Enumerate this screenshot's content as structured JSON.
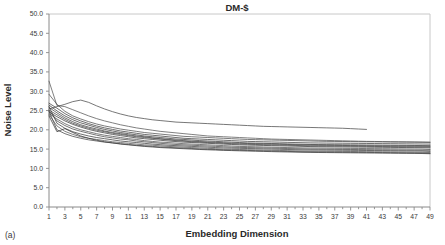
{
  "figure": {
    "panel_label": "(a)"
  },
  "chart_data": {
    "type": "line",
    "title": "DM-$",
    "xlabel": "Embedding Dimension",
    "ylabel": "Noise Level",
    "xlim": [
      1,
      49
    ],
    "ylim": [
      0.0,
      50.0
    ],
    "grid": false,
    "legend": "none",
    "y_ticks": [
      "0.0",
      "5.0",
      "10.0",
      "15.0",
      "20.0",
      "25.0",
      "30.0",
      "35.0",
      "40.0",
      "45.0",
      "50.0"
    ],
    "y_tick_values": [
      0.0,
      5.0,
      10.0,
      15.0,
      20.0,
      25.0,
      30.0,
      35.0,
      40.0,
      45.0,
      50.0
    ],
    "x_ticks": [
      "1",
      "3",
      "5",
      "7",
      "9",
      "11",
      "13",
      "15",
      "17",
      "19",
      "21",
      "23",
      "25",
      "27",
      "29",
      "31",
      "33",
      "35",
      "37",
      "39",
      "41",
      "43",
      "45",
      "47",
      "49"
    ],
    "x_tick_values": [
      1,
      3,
      5,
      7,
      9,
      11,
      13,
      15,
      17,
      19,
      21,
      23,
      25,
      27,
      29,
      31,
      33,
      35,
      37,
      39,
      41,
      43,
      45,
      47,
      49
    ],
    "x_minor_step": 1,
    "x": [
      1,
      2,
      3,
      4,
      5,
      6,
      7,
      8,
      9,
      10,
      11,
      12,
      13,
      14,
      15,
      16,
      17,
      18,
      19,
      20,
      21,
      22,
      23,
      24,
      25,
      26,
      27,
      28,
      29,
      30,
      31,
      32,
      33,
      34,
      35,
      36,
      37,
      38,
      39,
      40,
      41,
      42,
      43,
      44,
      45,
      46,
      47,
      48,
      49
    ],
    "series": [
      {
        "name": "curve-1",
        "color": "#4a4a4a",
        "values": [
          25.4,
          26.0,
          26.6,
          27.3,
          27.7,
          27.1,
          26.2,
          25.4,
          24.7,
          24.1,
          23.6,
          23.2,
          22.9,
          22.6,
          22.4,
          22.2,
          22.0,
          21.9,
          21.8,
          21.7,
          21.6,
          21.5,
          21.4,
          21.3,
          21.2,
          21.1,
          21.0,
          20.9,
          20.85,
          20.8,
          20.75,
          20.7,
          20.65,
          20.6,
          20.55,
          20.5,
          20.45,
          20.4,
          20.3,
          20.2,
          20.1,
          null,
          null,
          null,
          null,
          null,
          null,
          null,
          null
        ]
      },
      {
        "name": "curve-2",
        "color": "#555555",
        "values": [
          32.6,
          26.3,
          26.0,
          25.2,
          24.4,
          23.6,
          22.9,
          22.3,
          21.8,
          21.3,
          20.9,
          20.5,
          20.2,
          19.9,
          19.6,
          19.4,
          19.2,
          19.0,
          18.8,
          18.6,
          18.4,
          18.3,
          18.2,
          18.1,
          18.0,
          17.9,
          17.8,
          17.7,
          17.6,
          17.55,
          17.5,
          17.45,
          17.4,
          17.35,
          17.3,
          17.25,
          17.2,
          17.15,
          17.1,
          17.05,
          17.0,
          16.98,
          16.95,
          16.92,
          16.9,
          16.88,
          16.86,
          16.84,
          16.8
        ]
      },
      {
        "name": "curve-3",
        "color": "#4f4f4f",
        "values": [
          29.2,
          26.6,
          24.8,
          23.6,
          22.8,
          22.1,
          21.5,
          21.0,
          20.6,
          20.2,
          19.9,
          19.6,
          19.3,
          19.1,
          18.9,
          18.7,
          18.5,
          18.3,
          18.2,
          18.1,
          18.0,
          17.9,
          17.8,
          17.7,
          17.6,
          17.5,
          17.45,
          17.4,
          17.35,
          17.3,
          17.25,
          17.2,
          17.15,
          17.1,
          17.05,
          17.0,
          16.98,
          16.96,
          16.94,
          16.92,
          16.9,
          16.88,
          16.86,
          16.84,
          16.82,
          16.8,
          16.78,
          16.76,
          16.74
        ]
      },
      {
        "name": "curve-4",
        "color": "#3f3f3f",
        "values": [
          26.9,
          25.6,
          24.2,
          23.1,
          22.3,
          21.6,
          21.0,
          20.5,
          20.1,
          19.7,
          19.4,
          19.1,
          18.8,
          18.6,
          18.4,
          18.2,
          18.0,
          17.8,
          17.7,
          17.6,
          17.5,
          17.4,
          17.3,
          17.2,
          17.1,
          17.0,
          16.95,
          16.9,
          16.85,
          16.8,
          16.75,
          16.7,
          16.65,
          16.6,
          16.58,
          16.56,
          16.54,
          16.52,
          16.5,
          16.48,
          16.46,
          16.44,
          16.42,
          16.4,
          16.38,
          16.36,
          16.34,
          16.32,
          16.3
        ]
      },
      {
        "name": "curve-5",
        "color": "#3a3a3a",
        "values": [
          26.4,
          24.9,
          23.6,
          22.6,
          21.8,
          21.2,
          20.6,
          20.1,
          19.7,
          19.3,
          19.0,
          18.7,
          18.4,
          18.2,
          18.0,
          17.8,
          17.6,
          17.5,
          17.35,
          17.2,
          17.1,
          17.0,
          16.9,
          16.8,
          16.7,
          16.6,
          16.55,
          16.5,
          16.45,
          16.4,
          16.35,
          16.3,
          16.25,
          16.2,
          16.18,
          16.16,
          16.14,
          16.12,
          16.1,
          16.08,
          16.06,
          16.04,
          16.02,
          16.0,
          15.98,
          15.96,
          15.94,
          15.92,
          15.9
        ]
      },
      {
        "name": "curve-6",
        "color": "#454545",
        "values": [
          25.8,
          24.4,
          23.1,
          22.1,
          21.3,
          20.7,
          20.2,
          19.7,
          19.3,
          19.0,
          18.7,
          18.4,
          18.2,
          17.9,
          17.7,
          17.5,
          17.35,
          17.2,
          17.05,
          16.95,
          16.85,
          16.75,
          16.65,
          16.55,
          16.5,
          16.45,
          16.4,
          16.35,
          16.3,
          16.25,
          16.2,
          16.15,
          16.1,
          16.05,
          16.0,
          15.98,
          15.96,
          15.94,
          15.92,
          15.9,
          15.88,
          15.86,
          15.84,
          15.82,
          15.8,
          15.78,
          15.76,
          15.74,
          15.7
        ]
      },
      {
        "name": "curve-7",
        "color": "#4a4a4a",
        "values": [
          25.1,
          23.9,
          22.7,
          21.7,
          21.0,
          20.4,
          19.9,
          19.5,
          19.1,
          18.8,
          18.5,
          18.2,
          18.0,
          17.8,
          17.6,
          17.4,
          17.2,
          17.05,
          16.9,
          16.8,
          16.7,
          16.6,
          16.5,
          16.4,
          16.3,
          16.25,
          16.2,
          16.15,
          16.1,
          16.05,
          16.0,
          15.95,
          15.9,
          15.85,
          15.82,
          15.8,
          15.78,
          15.76,
          15.74,
          15.72,
          15.7,
          15.68,
          15.66,
          15.64,
          15.62,
          15.6,
          15.58,
          15.56,
          15.5
        ]
      },
      {
        "name": "curve-8",
        "color": "#3c3c3c",
        "values": [
          24.6,
          23.4,
          22.3,
          21.4,
          20.7,
          20.1,
          19.6,
          19.2,
          18.8,
          18.5,
          18.2,
          17.9,
          17.7,
          17.5,
          17.3,
          17.1,
          16.95,
          16.8,
          16.7,
          16.6,
          16.5,
          16.4,
          16.3,
          16.2,
          16.1,
          16.05,
          16.0,
          15.95,
          15.9,
          15.85,
          15.8,
          15.75,
          15.7,
          15.65,
          15.62,
          15.6,
          15.58,
          15.56,
          15.54,
          15.52,
          15.5,
          15.48,
          15.46,
          15.44,
          15.42,
          15.4,
          15.38,
          15.36,
          15.3
        ]
      },
      {
        "name": "curve-9",
        "color": "#505050",
        "values": [
          24.2,
          22.8,
          21.6,
          20.7,
          20.0,
          19.5,
          19.0,
          18.6,
          18.3,
          18.0,
          17.7,
          17.5,
          17.2,
          17.0,
          16.8,
          16.7,
          16.55,
          16.4,
          16.3,
          16.2,
          16.1,
          16.0,
          15.9,
          15.8,
          15.7,
          15.65,
          15.6,
          15.55,
          15.5,
          15.45,
          15.4,
          15.35,
          15.3,
          15.28,
          15.26,
          15.24,
          15.22,
          15.2,
          15.18,
          15.16,
          15.14,
          15.12,
          15.1,
          15.08,
          15.06,
          15.04,
          15.02,
          15.0,
          14.9
        ]
      },
      {
        "name": "curve-10",
        "color": "#484848",
        "values": [
          25.0,
          22.3,
          21.1,
          20.2,
          19.6,
          19.1,
          18.6,
          18.2,
          17.9,
          17.6,
          17.4,
          17.1,
          16.9,
          16.7,
          16.5,
          16.35,
          16.2,
          16.1,
          16.0,
          15.9,
          15.8,
          15.7,
          15.6,
          15.5,
          15.45,
          15.4,
          15.35,
          15.3,
          15.25,
          15.2,
          15.15,
          15.1,
          15.05,
          15.0,
          14.98,
          14.96,
          14.94,
          14.92,
          14.9,
          14.88,
          14.86,
          14.84,
          14.82,
          14.8,
          14.78,
          14.76,
          14.74,
          14.72,
          14.7
        ]
      },
      {
        "name": "curve-11",
        "color": "#3e3e3e",
        "values": [
          26.0,
          21.7,
          20.4,
          19.5,
          18.9,
          18.4,
          18.0,
          17.7,
          17.4,
          17.1,
          16.9,
          16.7,
          16.5,
          16.3,
          16.15,
          16.0,
          15.9,
          15.8,
          15.7,
          15.6,
          15.5,
          15.4,
          15.3,
          15.25,
          15.2,
          15.15,
          15.1,
          15.05,
          15.0,
          14.95,
          14.9,
          14.85,
          14.8,
          14.78,
          14.76,
          14.74,
          14.72,
          14.7,
          14.68,
          14.66,
          14.64,
          14.62,
          14.6,
          14.58,
          14.56,
          14.54,
          14.52,
          14.5,
          14.4
        ]
      },
      {
        "name": "curve-12",
        "color": "#555555",
        "values": [
          24.0,
          21.0,
          19.6,
          18.8,
          18.2,
          17.8,
          17.5,
          17.2,
          16.9,
          16.7,
          16.5,
          16.3,
          16.1,
          16.0,
          15.85,
          15.7,
          15.6,
          15.5,
          15.4,
          15.3,
          15.2,
          15.1,
          15.0,
          14.95,
          14.9,
          14.85,
          14.8,
          14.75,
          14.7,
          14.65,
          14.6,
          14.55,
          14.5,
          14.48,
          14.46,
          14.44,
          14.42,
          14.4,
          14.38,
          14.36,
          14.34,
          14.32,
          14.3,
          14.28,
          14.26,
          14.24,
          14.22,
          14.2,
          14.1
        ]
      },
      {
        "name": "curve-13",
        "color": "#464646",
        "values": [
          24.8,
          20.0,
          19.0,
          18.3,
          17.8,
          17.4,
          17.1,
          16.8,
          16.6,
          16.4,
          16.2,
          16.0,
          15.85,
          15.7,
          15.55,
          15.45,
          15.35,
          15.25,
          15.15,
          15.05,
          14.95,
          14.9,
          14.8,
          14.75,
          14.7,
          14.65,
          14.6,
          14.55,
          14.5,
          14.45,
          14.4,
          14.35,
          14.3,
          14.28,
          14.26,
          14.24,
          14.22,
          14.2,
          14.18,
          14.16,
          14.14,
          14.12,
          14.1,
          14.08,
          14.06,
          14.04,
          14.02,
          14.0,
          13.9
        ]
      },
      {
        "name": "curve-14",
        "color": "#3a3a3a",
        "values": [
          23.6,
          19.5,
          20.3,
          19.3,
          18.4,
          17.8,
          17.3,
          16.9,
          16.6,
          16.3,
          16.1,
          15.9,
          15.7,
          15.55,
          15.4,
          15.3,
          15.2,
          15.1,
          15.0,
          14.9,
          14.82,
          14.75,
          14.68,
          14.62,
          14.56,
          14.5,
          14.45,
          14.4,
          14.35,
          14.3,
          14.26,
          14.22,
          14.18,
          14.15,
          14.12,
          14.1,
          14.08,
          14.06,
          14.04,
          14.02,
          14.0,
          13.98,
          13.96,
          13.94,
          13.92,
          13.9,
          13.88,
          13.86,
          13.8
        ]
      }
    ]
  }
}
